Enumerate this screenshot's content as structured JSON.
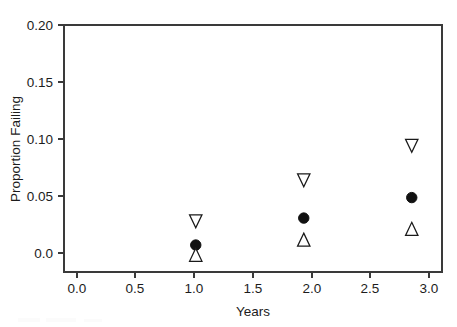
{
  "chart_data": {
    "type": "scatter",
    "title": "",
    "xlabel": "Years",
    "ylabel": "Proportion Failing",
    "x": [
      1.0,
      2.0,
      3.0
    ],
    "xlim": [
      -0.22,
      3.28
    ],
    "ylim": [
      -0.012,
      0.217
    ],
    "grid": false,
    "legend": "none",
    "xticks": [
      "0.0",
      "0.5",
      "1.0",
      "1.5",
      "2.0",
      "2.5",
      "3.0"
    ],
    "xtick_values": [
      0.0,
      0.5,
      1.0,
      1.5,
      2.0,
      2.5,
      3.0
    ],
    "yticks": [
      "0.0",
      "0.05",
      "0.10",
      "0.15",
      "0.20"
    ],
    "ytick_values": [
      0.0,
      0.05,
      0.1,
      0.15,
      0.2
    ],
    "series": [
      {
        "name": "upper-bound",
        "marker": "triangle-down-open",
        "color": "#1a1a1a",
        "values": [
          0.035,
          0.073,
          0.105
        ]
      },
      {
        "name": "estimate",
        "marker": "circle-filled",
        "color": "#111111",
        "values": [
          0.013,
          0.038,
          0.057
        ]
      },
      {
        "name": "lower-bound",
        "marker": "triangle-up-open",
        "color": "#1a1a1a",
        "values": [
          0.004,
          0.018,
          0.028
        ]
      }
    ]
  },
  "axes": {
    "x_title": "Years",
    "y_title": "Proportion Failing"
  },
  "colors": {
    "axis": "#3a3a3a",
    "text": "#1c1c1c",
    "marker_fill": "#111111",
    "marker_open": "#ffffff",
    "background": "#ffffff"
  }
}
